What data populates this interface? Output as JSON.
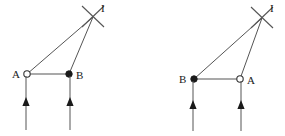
{
  "figure": {
    "stroke_color": "#555555",
    "accent_color": "#222222",
    "background_color": "#ffffff",
    "line_width": 1
  },
  "diagrams": [
    {
      "id": "left",
      "image_point": {
        "label": "I",
        "x": 93,
        "y": 17,
        "label_x": 101,
        "label_y": 12,
        "marker": "cross-mark",
        "marker_arm1": {
          "x1": 82,
          "y1": 6,
          "x2": 104,
          "y2": 27
        },
        "marker_arm2": {
          "x1": 104,
          "y1": 6,
          "x2": 82,
          "y2": 27
        }
      },
      "points": [
        {
          "label": "A",
          "x": 27,
          "y": 74,
          "marker": "open-circle",
          "label_x": 12,
          "label_y": 78,
          "label_anchor": "start"
        },
        {
          "label": "B",
          "x": 69,
          "y": 74,
          "marker": "filled-circle",
          "label_x": 76,
          "label_y": 79,
          "label_anchor": "start"
        }
      ],
      "baseline": {
        "x1": 27,
        "y1": 74,
        "x2": 69,
        "y2": 74
      },
      "rays": [
        {
          "name": "ray-a-to-i",
          "x1": 27,
          "y1": 74,
          "x2": 93,
          "y2": 17
        },
        {
          "name": "ray-b-to-i",
          "x1": 69,
          "y1": 74,
          "x2": 93,
          "y2": 17
        }
      ],
      "incident_arrows": [
        {
          "name": "incident-arrow-left",
          "x": 26,
          "y_start": 130,
          "y_end": 76,
          "head_y": 101
        },
        {
          "name": "incident-arrow-right",
          "x": 70,
          "y_start": 130,
          "y_end": 76,
          "head_y": 101
        }
      ]
    },
    {
      "id": "right",
      "image_point": {
        "label": "I",
        "x": 262,
        "y": 18,
        "label_x": 270,
        "label_y": 12,
        "marker": "cross-mark",
        "marker_arm1": {
          "x1": 251,
          "y1": 7,
          "x2": 273,
          "y2": 28
        },
        "marker_arm2": {
          "x1": 273,
          "y1": 7,
          "x2": 251,
          "y2": 28
        }
      },
      "points": [
        {
          "label": "B",
          "x": 194,
          "y": 79,
          "marker": "filled-circle",
          "label_x": 179,
          "label_y": 83,
          "label_anchor": "start"
        },
        {
          "label": "A",
          "x": 240,
          "y": 79,
          "marker": "open-circle",
          "label_x": 247,
          "label_y": 84,
          "label_anchor": "start"
        }
      ],
      "baseline": {
        "x1": 194,
        "y1": 79,
        "x2": 240,
        "y2": 79
      },
      "rays": [
        {
          "name": "ray-b-to-i",
          "x1": 194,
          "y1": 79,
          "x2": 262,
          "y2": 18
        },
        {
          "name": "ray-a-to-i",
          "x1": 240,
          "y1": 79,
          "x2": 262,
          "y2": 18
        }
      ],
      "incident_arrows": [
        {
          "name": "incident-arrow-left",
          "x": 193,
          "y_start": 131,
          "y_end": 81,
          "head_y": 104
        },
        {
          "name": "incident-arrow-right",
          "x": 241,
          "y_start": 131,
          "y_end": 81,
          "head_y": 104
        }
      ]
    }
  ],
  "labels": {
    "point_a": "A",
    "point_b": "B",
    "image_point": "I"
  }
}
